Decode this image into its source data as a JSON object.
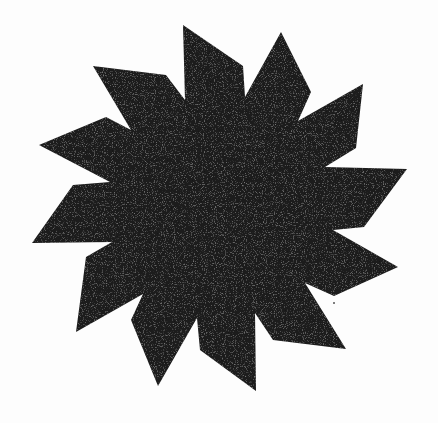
{
  "figure": {
    "description": "Twelve-point pinwheel star silhouette",
    "points_count": 12,
    "fill_color": "#1c1c1c",
    "background_color": "#fdfdfd",
    "texture": "grainy-halftone",
    "polygon": "183,25 243,66 245,97 281,32 311,92 298,121 363,84 356,148 325,167 407,169 364,227 333,230 398,267 334,296 305,283 346,349 273,340 255,313 256,391 200,350 197,318 158,386 131,320 143,294 76,332 86,257 112,242 32,243 73,185 110,182 39,145 106,117 131,130 93,66 166,75 185,100"
  }
}
